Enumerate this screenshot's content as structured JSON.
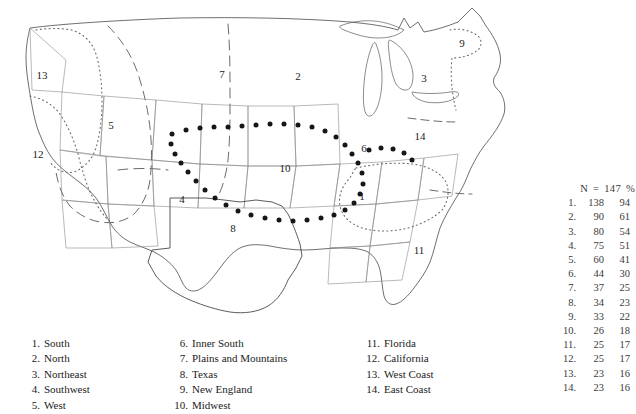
{
  "figure": {
    "type": "map",
    "title": "",
    "background_color": "#ffffff",
    "line_color": "#555555",
    "text_color": "#1b1b1b"
  },
  "map": {
    "region_numbers": [
      "1",
      "2",
      "3",
      "4",
      "5",
      "6",
      "7",
      "8",
      "9",
      "10",
      "11",
      "12",
      "13",
      "14"
    ]
  },
  "stats": {
    "header": {
      "n_label": "N",
      "equals": "=",
      "n_value": "147",
      "percent_label": "%"
    },
    "rows": [
      {
        "rank": "1.",
        "n": "138",
        "pct": "94"
      },
      {
        "rank": "2.",
        "n": "90",
        "pct": "61"
      },
      {
        "rank": "3.",
        "n": "80",
        "pct": "54"
      },
      {
        "rank": "4.",
        "n": "75",
        "pct": "51"
      },
      {
        "rank": "5.",
        "n": "60",
        "pct": "41"
      },
      {
        "rank": "6.",
        "n": "44",
        "pct": "30"
      },
      {
        "rank": "7.",
        "n": "37",
        "pct": "25"
      },
      {
        "rank": "8.",
        "n": "34",
        "pct": "23"
      },
      {
        "rank": "9.",
        "n": "33",
        "pct": "22"
      },
      {
        "rank": "10.",
        "n": "26",
        "pct": "18"
      },
      {
        "rank": "11.",
        "n": "25",
        "pct": "17"
      },
      {
        "rank": "12.",
        "n": "25",
        "pct": "17"
      },
      {
        "rank": "13.",
        "n": "23",
        "pct": "16"
      },
      {
        "rank": "14.",
        "n": "23",
        "pct": "16"
      }
    ]
  },
  "legend": {
    "column_1": [
      {
        "num": "1.",
        "label": "South"
      },
      {
        "num": "2.",
        "label": "North"
      },
      {
        "num": "3.",
        "label": "Northeast"
      },
      {
        "num": "4.",
        "label": "Southwest"
      },
      {
        "num": "5.",
        "label": "West"
      }
    ],
    "column_2": [
      {
        "num": "6.",
        "label": "Inner South"
      },
      {
        "num": "7.",
        "label": "Plains and Mountains"
      },
      {
        "num": "8.",
        "label": "Texas"
      },
      {
        "num": "9.",
        "label": "New England"
      },
      {
        "num": "10.",
        "label": "Midwest"
      }
    ],
    "column_3": [
      {
        "num": "11.",
        "label": "Florida"
      },
      {
        "num": "12.",
        "label": "California"
      },
      {
        "num": "13.",
        "label": "West Coast"
      },
      {
        "num": "14.",
        "label": "East Coast"
      }
    ]
  }
}
